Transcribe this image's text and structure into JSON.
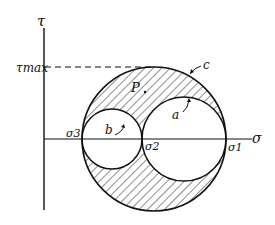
{
  "diagram": {
    "axes": {
      "vertical_label": "τ",
      "horizontal_label": "σ",
      "tau_max_label": "τmax"
    },
    "circles": [
      {
        "id": "c",
        "label": "c",
        "cx": 154,
        "cy": 139,
        "r": 72
      },
      {
        "id": "b",
        "label": "b",
        "cx": 112,
        "cy": 139,
        "r": 30
      },
      {
        "id": "a",
        "label": "a",
        "cx": 184,
        "cy": 139,
        "r": 42
      }
    ],
    "point_labels": {
      "sigma3": "σ3",
      "sigma2": "σ2",
      "sigma1": "σ1",
      "P": "P"
    },
    "colors": {
      "line": "#111111",
      "background": "#ffffff"
    }
  }
}
